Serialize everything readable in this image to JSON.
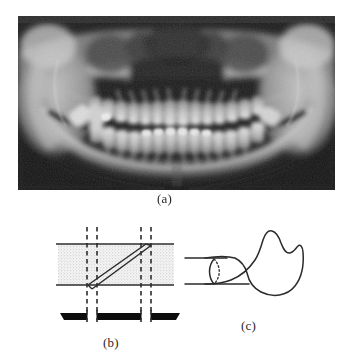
{
  "figure": {
    "panels": [
      {
        "id": "a",
        "caption": "(a)",
        "kind": "panoramic-radiograph",
        "description": "Panoramic dental radiograph (orthopantomogram) showing the maxilla, mandible and full dentition"
      },
      {
        "id": "b",
        "caption": "(b)",
        "kind": "schematic-diagram",
        "description": "Schematic cross-section: stippled band crossed by an oblique double line and four dashed vertical lines standing on a solid black base"
      },
      {
        "id": "c",
        "caption": "(c)",
        "kind": "line-drawing",
        "description": "Outline drawing of a mandibular ramus with a dotted elliptical cross-section between two horizontal lines"
      }
    ]
  },
  "colors": {
    "background": "#ffffff",
    "ink": "#262626",
    "band_fill": "#e9e9e9",
    "base_bar": "#101010",
    "radiograph_dark": "#1b1b1b",
    "radiograph_light": "#d8d8d8"
  },
  "panel_b": {
    "band_top_line": "horizontal rule at top of stippled band",
    "band_bottom_line": "horizontal rule at bottom of stippled band",
    "oblique_element": "double parallel oblique line",
    "dashed_line_count": 4,
    "base_bar": "solid black horizontal base"
  },
  "panel_c": {
    "ramus_outline": "mandibular ramus silhouette with coronoid and condylar processes",
    "cross_section": "dotted ellipse indicating a cylindrical cut",
    "guide_lines": 2
  }
}
